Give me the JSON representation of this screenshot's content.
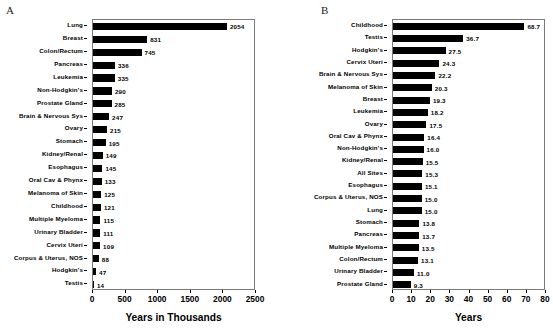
{
  "figure": {
    "panel_a_letter": "A",
    "panel_b_letter": "B"
  },
  "chart_data": [
    {
      "type": "bar",
      "orientation": "horizontal",
      "panel": "A",
      "title": "",
      "xlabel": "Years in Thousands",
      "ylabel": "",
      "xlim": [
        0,
        2500
      ],
      "xticks": [
        0,
        500,
        1000,
        1500,
        2000,
        2500
      ],
      "xticklabels": [
        "0",
        "500",
        "1000",
        "1500",
        "2000",
        "2500"
      ],
      "grid": false,
      "legend": null,
      "bar_color": "#000000",
      "categories": [
        "Lung",
        "Breast",
        "Colon/Rectum",
        "Pancreas",
        "Leukemia",
        "Non-Hodgkin's",
        "Prostate Gland",
        "Brain & Nervous Sys",
        "Ovary",
        "Stomach",
        "Kidney/Renal",
        "Esophagus",
        "Oral Cav & Phynx",
        "Melanoma of Skin",
        "Childhood",
        "Multiple Myeloma",
        "Urinary Bladder",
        "Cervix Uteri",
        "Corpus & Uterus, NOS",
        "Hodgkin's",
        "Testis"
      ],
      "values": [
        2054,
        831,
        745,
        336,
        335,
        290,
        285,
        247,
        215,
        195,
        149,
        145,
        133,
        125,
        121,
        115,
        111,
        109,
        88,
        47,
        14
      ],
      "value_labels": [
        "2054",
        "831",
        "745",
        "336",
        "335",
        "290",
        "285",
        "247",
        "215",
        "195",
        "149",
        "145",
        "133",
        "125",
        "121",
        "115",
        "111",
        "109",
        "88",
        "47",
        "14"
      ]
    },
    {
      "type": "bar",
      "orientation": "horizontal",
      "panel": "B",
      "title": "",
      "xlabel": "Years",
      "ylabel": "",
      "xlim": [
        0,
        80
      ],
      "xticks": [
        0,
        10,
        20,
        30,
        40,
        50,
        60,
        70,
        80
      ],
      "xticklabels": [
        "0",
        "10",
        "20",
        "30",
        "40",
        "50",
        "60",
        "70",
        "80"
      ],
      "grid": false,
      "legend": null,
      "bar_color": "#000000",
      "categories": [
        "Childhood",
        "Testis",
        "Hodgkin's",
        "Cervix Uteri",
        "Brain & Nervous Sys",
        "Melanoma of Skin",
        "Breast",
        "Leukemia",
        "Ovary",
        "Oral Cav & Phynx",
        "Non-Hodgkin's",
        "Kidney/Renal",
        "All Sites",
        "Esophagus",
        "Corpus & Uterus, NOS",
        "Lung",
        "Stomach",
        "Pancreas",
        "Multiple Myeloma",
        "Colon/Rectum",
        "Urinary Bladder",
        "Prostate Gland"
      ],
      "values": [
        68.7,
        36.7,
        27.5,
        24.3,
        22.2,
        20.3,
        19.3,
        18.2,
        17.5,
        16.4,
        16.0,
        15.5,
        15.3,
        15.1,
        15.0,
        15.0,
        13.8,
        13.7,
        13.5,
        13.1,
        11.0,
        9.3
      ],
      "value_labels": [
        "68.7",
        "36.7",
        "27.5",
        "24.3",
        "22.2",
        "20.3",
        "19.3",
        "18.2",
        "17.5",
        "16.4",
        "16.0",
        "15.5",
        "15.3",
        "15.1",
        "15.0",
        "15.0",
        "13.8",
        "13.7",
        "13.5",
        "13.1",
        "11.0",
        "9.3"
      ]
    }
  ]
}
